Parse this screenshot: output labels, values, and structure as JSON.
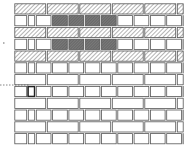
{
  "diagram": {
    "type": "brick-wall-elevation",
    "colors": {
      "background": "#ffffff",
      "mortar": "#ffffff",
      "outline": "#555555",
      "hatch": "#8a8a8a",
      "shaded_brick": "#6e6e6e",
      "plain_brick": "#ffffff",
      "callout": "#666666"
    },
    "wall": {
      "x": 14,
      "y": 3,
      "width": 170,
      "course_height": 11.8,
      "courses": 12
    },
    "courses": [
      {
        "index": 0,
        "style": "hatched-stretchers",
        "offset": 0
      },
      {
        "index": 1,
        "style": "mixed-headers-shaded",
        "shaded_range": [
          3,
          6
        ]
      },
      {
        "index": 2,
        "style": "hatched-stretchers",
        "offset": 0
      },
      {
        "index": 3,
        "style": "mixed-headers-shaded",
        "shaded_range": [
          3,
          6
        ]
      },
      {
        "index": 4,
        "style": "hatched-stretchers",
        "offset": 0
      },
      {
        "index": 5,
        "style": "plain-headers"
      },
      {
        "index": 6,
        "style": "plain-stretchers"
      },
      {
        "index": 7,
        "style": "plain-headers",
        "highlighted_brick": 1
      },
      {
        "index": 8,
        "style": "plain-stretchers"
      },
      {
        "index": 9,
        "style": "plain-headers"
      },
      {
        "index": 10,
        "style": "plain-stretchers"
      },
      {
        "index": 11,
        "style": "plain-headers"
      }
    ],
    "annotations": [
      {
        "type": "tick-mark",
        "x": 3,
        "y": 43
      },
      {
        "type": "dashed-callout",
        "from": [
          0,
          85
        ],
        "to": [
          30,
          85
        ],
        "target": "highlighted closer brick"
      }
    ]
  }
}
